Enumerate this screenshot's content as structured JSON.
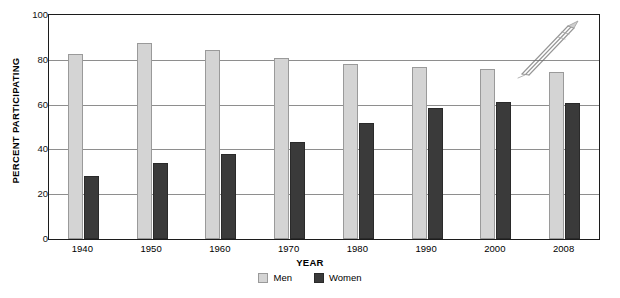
{
  "chart_data": {
    "type": "bar",
    "title": "",
    "xlabel": "YEAR",
    "ylabel": "PERCENT PARTICIPATING",
    "categories": [
      "1940",
      "1950",
      "1960",
      "1970",
      "1980",
      "1990",
      "2000",
      "2008"
    ],
    "series": [
      {
        "name": "Men",
        "color": "#d4d4d4",
        "values": [
          82.5,
          87.5,
          84.5,
          81.0,
          78.0,
          77.0,
          76.0,
          74.5
        ]
      },
      {
        "name": "Women",
        "color": "#3a3a3a",
        "values": [
          28.0,
          34.0,
          38.0,
          43.5,
          52.0,
          58.5,
          61.0,
          60.5
        ]
      }
    ],
    "ylim": [
      0,
      100
    ],
    "yticks": [
      0,
      20,
      40,
      60,
      80,
      100
    ],
    "ytick_labels": [
      "0",
      "20",
      "40",
      "60",
      "80",
      "100"
    ],
    "grid": true,
    "grid_axis": "y",
    "legend_position": "bottom-center"
  },
  "legend": {
    "entries": [
      {
        "label": "Men",
        "swatch": "men-swatch"
      },
      {
        "label": "Women",
        "swatch": "women-swatch"
      }
    ]
  },
  "artifacts": {
    "pen_icon_name": "pen-scan-artifact",
    "caption_strip_text": ""
  }
}
